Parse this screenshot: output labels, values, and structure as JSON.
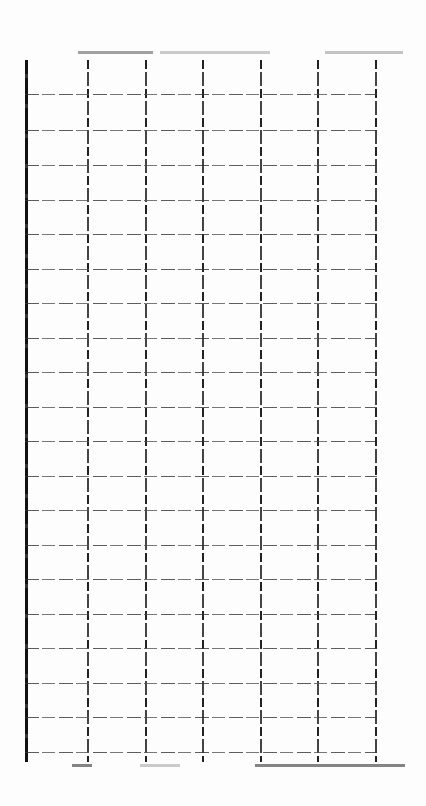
{
  "document": {
    "type": "blank ledger grid (scanned)",
    "header_text": "",
    "columns": 6,
    "column_x": [
      25,
      87,
      145,
      202,
      260,
      317,
      375
    ],
    "row_y": [
      60,
      94,
      130,
      165,
      200,
      234,
      269,
      303,
      338,
      372,
      407,
      441,
      476,
      510,
      545,
      579,
      614,
      648,
      683,
      717,
      752
    ],
    "cells": []
  }
}
